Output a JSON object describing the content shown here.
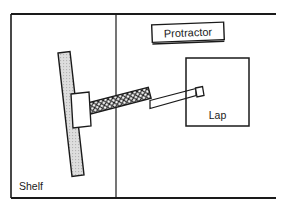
{
  "figure": {
    "kind": "technical-line-drawing",
    "width": 285,
    "height": 211,
    "background_color": "#ffffff",
    "line_color": "#1a1a1a",
    "labels": {
      "shelf": "Shelf",
      "lap": "Lap",
      "protractor": "Protractor"
    },
    "parts": {
      "outer_frame": {
        "name": "outer-frame",
        "description": "open-right rectangular border",
        "left": 11,
        "top": 14,
        "right": 276,
        "bottom": 198,
        "stroke_width": 1.6,
        "right_side_open": true
      },
      "vertical_divider": {
        "name": "vertical-divider",
        "x": 116,
        "y_top": 14,
        "y_bottom": 198,
        "stroke_width": 1.2
      },
      "tilted_board": {
        "name": "tilted-board",
        "fill": "#d8d8d8",
        "tilt_degrees": 8,
        "description": "hatched upright board representing the shelf face"
      },
      "mount_block": {
        "name": "mount-block",
        "fill": "#ffffff",
        "description": "white rectangular mounting block on the board"
      },
      "knurled_shaft": {
        "name": "knurled-shaft",
        "pattern": "crosshatch",
        "description": "diamond-crosshatched flexible shaft section"
      },
      "tapered_rod": {
        "name": "tapered-rod",
        "fill": "#ffffff",
        "description": "tapered rod running from shaft to the lap"
      },
      "rod_tip": {
        "name": "rod-tip",
        "fill": "#ffffff",
        "description": "small rectangular tip inside the lap box"
      },
      "lap_box": {
        "name": "lap-box",
        "left": 186,
        "top": 58,
        "right": 249,
        "bottom": 126,
        "stroke_width": 1.5
      },
      "protractor_box": {
        "name": "protractor-box",
        "tilt_degrees": -2.2,
        "stroke_width": 1.4,
        "double_bottom_rule": true
      }
    }
  }
}
